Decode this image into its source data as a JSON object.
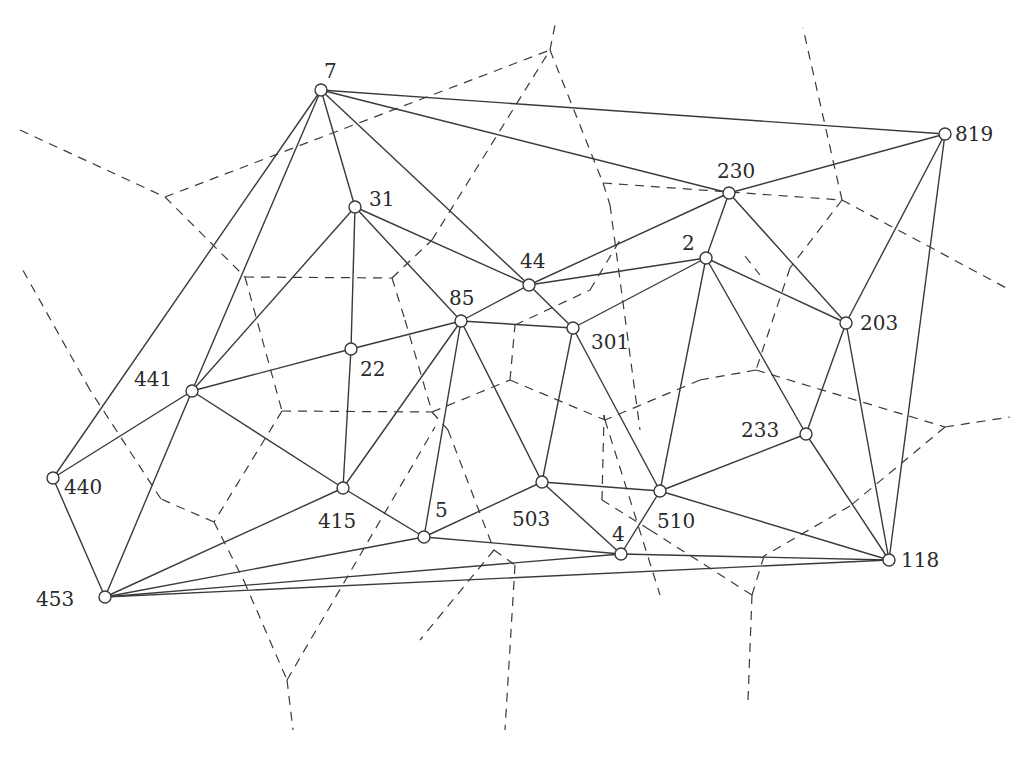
{
  "diagram": {
    "type": "delaunay-voronoi",
    "colors": {
      "stroke": "#3a3a3a",
      "node_fill": "#ffffff",
      "background": "#ffffff"
    },
    "nodes": [
      {
        "id": "7",
        "x": 321,
        "y": 90,
        "lx": 324,
        "ly": 78,
        "anchor": "start"
      },
      {
        "id": "819",
        "x": 945,
        "y": 134,
        "lx": 955,
        "ly": 141,
        "anchor": "start"
      },
      {
        "id": "230",
        "x": 729,
        "y": 193,
        "lx": 717,
        "ly": 178,
        "anchor": "start"
      },
      {
        "id": "31",
        "x": 355,
        "y": 207,
        "lx": 369,
        "ly": 206,
        "anchor": "start"
      },
      {
        "id": "2",
        "x": 706,
        "y": 258,
        "lx": 682,
        "ly": 250,
        "anchor": "start"
      },
      {
        "id": "44",
        "x": 529,
        "y": 285,
        "lx": 520,
        "ly": 268,
        "anchor": "start"
      },
      {
        "id": "85",
        "x": 461,
        "y": 321,
        "lx": 449,
        "ly": 305,
        "anchor": "start"
      },
      {
        "id": "301",
        "x": 573,
        "y": 328,
        "lx": 591,
        "ly": 349,
        "anchor": "start"
      },
      {
        "id": "203",
        "x": 846,
        "y": 323,
        "lx": 860,
        "ly": 330,
        "anchor": "start"
      },
      {
        "id": "22",
        "x": 351,
        "y": 349,
        "lx": 360,
        "ly": 376,
        "anchor": "start"
      },
      {
        "id": "441",
        "x": 192,
        "y": 391,
        "lx": 134,
        "ly": 386,
        "anchor": "start"
      },
      {
        "id": "233",
        "x": 806,
        "y": 434,
        "lx": 741,
        "ly": 437,
        "anchor": "start"
      },
      {
        "id": "440",
        "x": 53,
        "y": 478,
        "lx": 64,
        "ly": 494,
        "anchor": "start"
      },
      {
        "id": "415",
        "x": 343,
        "y": 488,
        "lx": 318,
        "ly": 528,
        "anchor": "start"
      },
      {
        "id": "503",
        "x": 542,
        "y": 482,
        "lx": 512,
        "ly": 526,
        "anchor": "start"
      },
      {
        "id": "510",
        "x": 660,
        "y": 491,
        "lx": 657,
        "ly": 528,
        "anchor": "start"
      },
      {
        "id": "5",
        "x": 424,
        "y": 537,
        "lx": 435,
        "ly": 517,
        "anchor": "start"
      },
      {
        "id": "4",
        "x": 621,
        "y": 554,
        "lx": 612,
        "ly": 541,
        "anchor": "start"
      },
      {
        "id": "118",
        "x": 889,
        "y": 560,
        "lx": 901,
        "ly": 567,
        "anchor": "start"
      },
      {
        "id": "453",
        "x": 105,
        "y": 597,
        "lx": 36,
        "ly": 606,
        "anchor": "start"
      }
    ],
    "edges": [
      [
        "7",
        "819"
      ],
      [
        "7",
        "230"
      ],
      [
        "7",
        "31"
      ],
      [
        "7",
        "441"
      ],
      [
        "7",
        "440"
      ],
      [
        "7",
        "44"
      ],
      [
        "819",
        "230"
      ],
      [
        "819",
        "203"
      ],
      [
        "819",
        "118"
      ],
      [
        "230",
        "44"
      ],
      [
        "230",
        "2"
      ],
      [
        "230",
        "203"
      ],
      [
        "31",
        "44"
      ],
      [
        "31",
        "85"
      ],
      [
        "31",
        "22"
      ],
      [
        "31",
        "441"
      ],
      [
        "44",
        "2"
      ],
      [
        "44",
        "85"
      ],
      [
        "44",
        "301"
      ],
      [
        "2",
        "301"
      ],
      [
        "2",
        "203"
      ],
      [
        "2",
        "510"
      ],
      [
        "2",
        "233"
      ],
      [
        "85",
        "301"
      ],
      [
        "85",
        "22"
      ],
      [
        "85",
        "415"
      ],
      [
        "85",
        "5"
      ],
      [
        "85",
        "503"
      ],
      [
        "301",
        "503"
      ],
      [
        "301",
        "510"
      ],
      [
        "203",
        "233"
      ],
      [
        "203",
        "118"
      ],
      [
        "22",
        "441"
      ],
      [
        "22",
        "415"
      ],
      [
        "441",
        "440"
      ],
      [
        "441",
        "415"
      ],
      [
        "441",
        "453"
      ],
      [
        "440",
        "453"
      ],
      [
        "415",
        "5"
      ],
      [
        "415",
        "453"
      ],
      [
        "5",
        "503"
      ],
      [
        "5",
        "4"
      ],
      [
        "5",
        "453"
      ],
      [
        "503",
        "510"
      ],
      [
        "503",
        "4"
      ],
      [
        "510",
        "4"
      ],
      [
        "510",
        "233"
      ],
      [
        "510",
        "118"
      ],
      [
        "233",
        "118"
      ],
      [
        "4",
        "118"
      ],
      [
        "4",
        "453"
      ],
      [
        "118",
        "453"
      ]
    ],
    "voronoi_segments": [
      [
        [
          20,
          130
        ],
        [
          165,
          197
        ]
      ],
      [
        [
          165,
          197
        ],
        [
          550,
          50
        ]
      ],
      [
        [
          165,
          197
        ],
        [
          245,
          277
        ]
      ],
      [
        [
          245,
          277
        ],
        [
          392,
          278
        ]
      ],
      [
        [
          392,
          278
        ],
        [
          432,
          240
        ]
      ],
      [
        [
          432,
          240
        ],
        [
          550,
          50
        ]
      ],
      [
        [
          550,
          50
        ],
        [
          555,
          25
        ]
      ],
      [
        [
          550,
          50
        ],
        [
          603,
          183
        ]
      ],
      [
        [
          603,
          183
        ],
        [
          842,
          200
        ]
      ],
      [
        [
          842,
          200
        ],
        [
          803,
          28
        ]
      ],
      [
        [
          842,
          200
        ],
        [
          1010,
          290
        ]
      ],
      [
        [
          603,
          183
        ],
        [
          610,
          205
        ]
      ],
      [
        [
          610,
          205
        ],
        [
          640,
          430
        ]
      ],
      [
        [
          745,
          256
        ],
        [
          760,
          275
        ]
      ],
      [
        [
          842,
          200
        ],
        [
          790,
          268
        ]
      ],
      [
        [
          790,
          268
        ],
        [
          756,
          370
        ]
      ],
      [
        [
          756,
          370
        ],
        [
          700,
          380
        ]
      ],
      [
        [
          700,
          380
        ],
        [
          605,
          420
        ]
      ],
      [
        [
          605,
          420
        ],
        [
          660,
          595
        ]
      ],
      [
        [
          756,
          370
        ],
        [
          945,
          427
        ]
      ],
      [
        [
          945,
          427
        ],
        [
          1010,
          417
        ]
      ],
      [
        [
          945,
          427
        ],
        [
          850,
          506
        ]
      ],
      [
        [
          850,
          506
        ],
        [
          764,
          556
        ]
      ],
      [
        [
          764,
          556
        ],
        [
          752,
          595
        ]
      ],
      [
        [
          752,
          595
        ],
        [
          748,
          700
        ]
      ],
      [
        [
          752,
          595
        ],
        [
          650,
          530
        ]
      ],
      [
        [
          650,
          530
        ],
        [
          602,
          500
        ]
      ],
      [
        [
          602,
          500
        ],
        [
          604,
          415
        ]
      ],
      [
        [
          604,
          415
        ],
        [
          605,
          420
        ]
      ],
      [
        [
          392,
          278
        ],
        [
          405,
          320
        ]
      ],
      [
        [
          405,
          320
        ],
        [
          432,
          412
        ]
      ],
      [
        [
          432,
          412
        ],
        [
          510,
          380
        ]
      ],
      [
        [
          510,
          380
        ],
        [
          515,
          325
        ]
      ],
      [
        [
          515,
          325
        ],
        [
          590,
          290
        ]
      ],
      [
        [
          590,
          290
        ],
        [
          620,
          240
        ]
      ],
      [
        [
          432,
          412
        ],
        [
          448,
          430
        ]
      ],
      [
        [
          448,
          430
        ],
        [
          494,
          550
        ]
      ],
      [
        [
          510,
          380
        ],
        [
          605,
          420
        ]
      ],
      [
        [
          245,
          277
        ],
        [
          282,
          411
        ]
      ],
      [
        [
          282,
          411
        ],
        [
          432,
          412
        ]
      ],
      [
        [
          282,
          411
        ],
        [
          214,
          522
        ]
      ],
      [
        [
          214,
          522
        ],
        [
          161,
          499
        ]
      ],
      [
        [
          161,
          499
        ],
        [
          90,
          390
        ]
      ],
      [
        [
          90,
          390
        ],
        [
          20,
          265
        ]
      ],
      [
        [
          214,
          522
        ],
        [
          244,
          581
        ]
      ],
      [
        [
          244,
          581
        ],
        [
          287,
          680
        ]
      ],
      [
        [
          287,
          680
        ],
        [
          293,
          730
        ]
      ],
      [
        [
          287,
          680
        ],
        [
          435,
          427
        ]
      ],
      [
        [
          494,
          550
        ],
        [
          515,
          565
        ]
      ],
      [
        [
          515,
          565
        ],
        [
          505,
          730
        ]
      ],
      [
        [
          494,
          550
        ],
        [
          420,
          640
        ]
      ]
    ]
  }
}
